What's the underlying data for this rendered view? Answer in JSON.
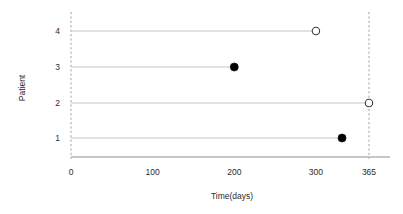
{
  "chart_data": {
    "type": "scatter",
    "title": "",
    "xlabel": "Time(days)",
    "ylabel": "Patient",
    "xlim": [
      0,
      390
    ],
    "ylim": [
      0.4,
      4.6
    ],
    "grid": false,
    "legend": null,
    "x_ticks": [
      {
        "value": 0,
        "label": "0"
      },
      {
        "value": 100,
        "label": "100"
      },
      {
        "value": 200,
        "label": "200"
      },
      {
        "value": 300,
        "label": "300"
      },
      {
        "value": 365,
        "label": "365"
      }
    ],
    "y_ticks": [
      {
        "value": 4,
        "label": "4"
      },
      {
        "value": 3,
        "label": "3"
      },
      {
        "value": 2,
        "label": "2"
      },
      {
        "value": 1,
        "label": "1"
      }
    ],
    "reference_lines": [
      {
        "name": "study-start",
        "x": 0,
        "style": "dashed"
      },
      {
        "name": "study-end",
        "x": 365,
        "style": "dashed"
      }
    ],
    "series": [
      {
        "name": "Patient 4",
        "patient": 4,
        "start": 0,
        "end": 300,
        "marker": "open-circle",
        "event": "censored"
      },
      {
        "name": "Patient 3",
        "patient": 3,
        "start": 0,
        "end": 200,
        "marker": "filled-circle",
        "event": "event"
      },
      {
        "name": "Patient 2",
        "patient": 2,
        "start": 0,
        "end": 365,
        "marker": "open-circle",
        "event": "censored"
      },
      {
        "name": "Patient 1",
        "patient": 1,
        "start": 0,
        "end": 332,
        "marker": "filled-circle",
        "event": "event"
      }
    ],
    "colors": {
      "line": "#c8c8c8",
      "axis": "#b4b4b4",
      "dashed": "#9a9a9a",
      "marker_fill": "#000000",
      "marker_edge": "#1a1a1a",
      "marker_open_fill": "#ffffff",
      "text": "#2b2b2b"
    }
  }
}
